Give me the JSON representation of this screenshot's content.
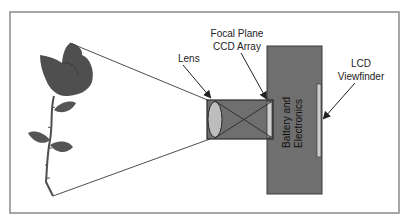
{
  "labels": {
    "lens": "Lens",
    "focal_plane_line1": "Focal Plane",
    "focal_plane_line2": "CCD Array",
    "battery_line1": "Battery and",
    "battery_line2": "Electronics",
    "lcd_line1": "LCD",
    "lcd_line2": "Viewfinder"
  },
  "colors": {
    "frame": "#8a8a8a",
    "body_fill": "#6f6f6f",
    "lens_fill": "#bdbdbd",
    "sensor_fill": "#cfcfcf",
    "line": "#3a3a3a",
    "rose": "#4f4f4f",
    "leaf": "#555555"
  }
}
